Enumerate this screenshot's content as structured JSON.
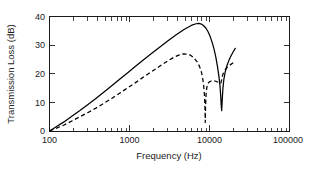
{
  "chart_data": {
    "type": "line",
    "title": "",
    "xlabel": "Frequency (Hz)",
    "ylabel": "Transmission Loss (dB)",
    "xscale": "log",
    "yscale": "linear",
    "xlim": [
      100,
      100000
    ],
    "ylim": [
      0,
      40
    ],
    "grid": false,
    "legend": null,
    "xticks": [
      100,
      1000,
      10000,
      100000
    ],
    "xticklabels": [
      "100",
      "1000",
      "10000",
      "100000"
    ],
    "yticks": [
      0,
      10,
      20,
      30,
      40
    ],
    "yticklabels": [
      "0",
      "10",
      "20",
      "30",
      "40"
    ],
    "series": [
      {
        "name": "solid",
        "style": "solid",
        "color": "#000000",
        "x": [
          100,
          120,
          150,
          190,
          240,
          300,
          380,
          480,
          600,
          760,
          950,
          1200,
          1500,
          1900,
          2400,
          3000,
          3800,
          4800,
          6000,
          6800,
          7400,
          7900,
          8400,
          9000,
          9600,
          10200,
          10800,
          11400,
          12000,
          12600,
          13100,
          13500,
          13800,
          14000,
          14200,
          14400,
          14700,
          15100,
          15700,
          16500,
          17500,
          18600,
          19800,
          21000
        ],
        "y": [
          0,
          1.4,
          3.1,
          5.2,
          7.2,
          9.2,
          11.4,
          13.6,
          15.8,
          18.2,
          20.4,
          22.7,
          24.9,
          27.2,
          29.4,
          31.5,
          33.6,
          35.5,
          37.0,
          37.5,
          37.6,
          37.4,
          36.9,
          36.0,
          34.7,
          33.0,
          31.0,
          28.6,
          25.8,
          22.4,
          19.2,
          16.0,
          12.5,
          9.2,
          7.1,
          10.5,
          14.8,
          18.0,
          20.6,
          22.8,
          24.7,
          26.3,
          27.7,
          28.9
        ]
      },
      {
        "name": "dashed",
        "style": "dashed",
        "color": "#000000",
        "x": [
          100,
          120,
          150,
          190,
          240,
          300,
          380,
          480,
          600,
          760,
          950,
          1200,
          1500,
          1900,
          2400,
          3000,
          3600,
          4200,
          4700,
          5200,
          5800,
          6400,
          7000,
          7500,
          7900,
          8200,
          8450,
          8650,
          8780,
          8850,
          8920,
          9050,
          9250,
          9550,
          9950,
          10500,
          11200,
          12000,
          12900,
          13500,
          13900,
          14200,
          14600,
          15200,
          16100,
          17200,
          18500,
          19900,
          21000
        ],
        "y": [
          0,
          0.9,
          2.0,
          3.5,
          5.0,
          6.4,
          8.0,
          9.7,
          11.4,
          13.3,
          15.1,
          17.0,
          18.9,
          20.8,
          22.7,
          24.5,
          25.8,
          26.6,
          27.0,
          26.9,
          26.5,
          25.6,
          24.2,
          22.6,
          20.8,
          18.6,
          16.0,
          12.5,
          8.0,
          3.0,
          8.0,
          12.5,
          15.2,
          16.6,
          17.2,
          17.5,
          17.6,
          17.4,
          17.0,
          16.6,
          16.8,
          18.0,
          19.6,
          20.8,
          21.8,
          22.6,
          23.3,
          23.9,
          24.2
        ]
      }
    ],
    "annotations": [
      {
        "label": "solid-peak",
        "x": 7400,
        "y": 37.6
      },
      {
        "label": "solid-notch",
        "x": 14000,
        "y": 7.1
      },
      {
        "label": "dashed-peak",
        "x": 4700,
        "y": 27.0
      },
      {
        "label": "dashed-notch",
        "x": 8850,
        "y": 0.0
      }
    ]
  },
  "figure": {
    "background_color": "#ffffff",
    "axis_color": "#1a1a1a",
    "curve_color": "#000000"
  }
}
